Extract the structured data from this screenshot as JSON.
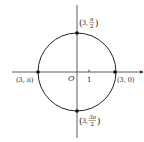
{
  "diagram": {
    "type": "polar-circle",
    "axes": {
      "origin_label": "O",
      "tick_label": "1"
    },
    "points": [
      {
        "id": "top",
        "r": "3",
        "theta": "π/2",
        "theta_num": "π",
        "theta_den": "2"
      },
      {
        "id": "left",
        "r": "3",
        "theta": "π",
        "label": "(3, π)"
      },
      {
        "id": "right",
        "r": "3",
        "theta": "0",
        "label": "(3, 0)"
      },
      {
        "id": "bottom",
        "r": "3",
        "theta": "3π/2",
        "theta_num": "3π",
        "theta_den": "2"
      }
    ],
    "colors": {
      "line": "#333333",
      "point": "#111111",
      "text": "#222222"
    }
  }
}
